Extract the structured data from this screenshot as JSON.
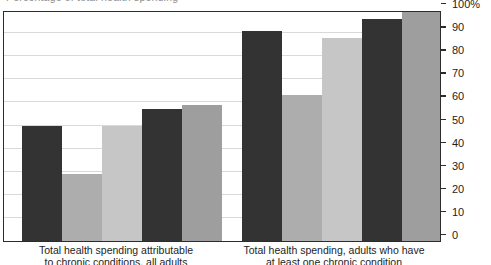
{
  "header": {
    "clipped_text": "Percentage of total health spending"
  },
  "chart_data": {
    "type": "bar",
    "title": "",
    "xlabel": "",
    "ylabel": "",
    "ylim": [
      0,
      100
    ],
    "grid": true,
    "legend": "none",
    "axis_side": "right",
    "tick_labels": [
      "100%",
      "90",
      "80",
      "70",
      "60",
      "50",
      "40",
      "30",
      "20",
      "10",
      "0"
    ],
    "tick_values": [
      100,
      90,
      80,
      70,
      60,
      50,
      40,
      30,
      20,
      10,
      0
    ],
    "categories": [
      "Total health spending attributable\nto chronic conditions, all adults",
      "Total health spending, adults who have\nat least one chronic condition"
    ],
    "category_lines": [
      [
        "Total health spending attributable",
        "to chronic conditions, all adults"
      ],
      [
        "Total health spending, adults who have",
        "at least one chronic condition"
      ]
    ],
    "series": [
      {
        "name": "Series 1",
        "color": "#333333",
        "values": [
          50,
          91
        ]
      },
      {
        "name": "Series 2",
        "color": "#adadad",
        "values": [
          29,
          63
        ]
      },
      {
        "name": "Series 3",
        "color": "#c6c6c6",
        "values": [
          50,
          88
        ]
      },
      {
        "name": "Series 4",
        "color": "#333333",
        "values": [
          57,
          96
        ]
      },
      {
        "name": "Series 5",
        "color": "#9e9e9e",
        "values": [
          59,
          99
        ]
      }
    ],
    "bars": [
      {
        "group": 0,
        "series": 0,
        "value": 50,
        "color": "#333333"
      },
      {
        "group": 0,
        "series": 1,
        "value": 29,
        "color": "#adadad"
      },
      {
        "group": 0,
        "series": 2,
        "value": 50,
        "color": "#c6c6c6"
      },
      {
        "group": 0,
        "series": 3,
        "value": 57,
        "color": "#333333"
      },
      {
        "group": 0,
        "series": 4,
        "value": 59,
        "color": "#9e9e9e"
      },
      {
        "group": 1,
        "series": 0,
        "value": 91,
        "color": "#333333"
      },
      {
        "group": 1,
        "series": 1,
        "value": 63,
        "color": "#adadad"
      },
      {
        "group": 1,
        "series": 2,
        "value": 88,
        "color": "#c6c6c6"
      },
      {
        "group": 1,
        "series": 3,
        "value": 96,
        "color": "#333333"
      },
      {
        "group": 1,
        "series": 4,
        "value": 99,
        "color": "#9e9e9e"
      }
    ],
    "layout": {
      "bar_width_px": 40,
      "group_starts_px": [
        18,
        238
      ],
      "bar_gap_px": 0,
      "plot_width_px": 438,
      "plot_height_px": 231,
      "colors": {
        "frame": "#2c2c2c",
        "gridline": "#d9d9d9",
        "background": "#ffffff",
        "text": "#1d1d1d"
      }
    }
  }
}
